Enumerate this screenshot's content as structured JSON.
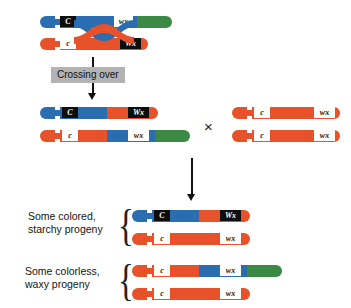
{
  "diagram": {
    "crossing_over_label": "Crossing over",
    "cross_symbol": "×",
    "brace_glyph": "{",
    "colors": {
      "blue": "#2a6db0",
      "red": "#e8522a",
      "green": "#3a8a45",
      "dark_box": "#0d0d0d",
      "light_box": "#fdfdfa",
      "label_box_bg": "#b3b3b3",
      "arrow": "#111111",
      "background": "#ffffff"
    },
    "alleles": {
      "C_dom": "C",
      "c_rec": "c",
      "Wx_dom": "Wx",
      "wx_rec": "wx"
    }
  },
  "parental_pair": {
    "caption": "Heterozygous parent before crossing over",
    "chromosomes": [
      {
        "id": "parental-blue",
        "color": "blue",
        "tip_color": "green",
        "alleles": [
          {
            "name": "C",
            "style": "dark"
          },
          {
            "name": "wx",
            "style": "light"
          }
        ]
      },
      {
        "id": "parental-red",
        "color": "red",
        "tip_color": "red",
        "alleles": [
          {
            "name": "c",
            "style": "light"
          },
          {
            "name": "Wx",
            "style": "dark"
          }
        ]
      }
    ]
  },
  "recombinant_pair": {
    "caption": "Recombinant chromosomes after crossing over",
    "chromosomes": [
      {
        "id": "recombinant-1",
        "segments": [
          "blue",
          "red"
        ],
        "alleles": [
          {
            "name": "C",
            "style": "dark"
          },
          {
            "name": "Wx",
            "style": "dark"
          }
        ]
      },
      {
        "id": "recombinant-2",
        "segments": [
          "red",
          "blue",
          "green"
        ],
        "alleles": [
          {
            "name": "c",
            "style": "light"
          },
          {
            "name": "wx",
            "style": "light"
          }
        ]
      }
    ]
  },
  "tester_pair": {
    "caption": "Homozygous recessive tester parent",
    "chromosomes": [
      {
        "id": "tester-1",
        "color": "red",
        "alleles": [
          {
            "name": "c",
            "style": "light"
          },
          {
            "name": "wx",
            "style": "light"
          }
        ]
      },
      {
        "id": "tester-2",
        "color": "red",
        "alleles": [
          {
            "name": "c",
            "style": "light"
          },
          {
            "name": "wx",
            "style": "light"
          }
        ]
      }
    ]
  },
  "progeny": [
    {
      "id": "progeny-colored-starchy",
      "label_line1": "Some colored,",
      "label_line2": "starchy progeny",
      "chromosomes": [
        {
          "id": "progeny-1-chrom-1",
          "segments": [
            "blue",
            "red"
          ],
          "alleles": [
            {
              "name": "C",
              "style": "dark"
            },
            {
              "name": "Wx",
              "style": "dark"
            }
          ]
        },
        {
          "id": "progeny-1-chrom-2",
          "segments": [
            "red"
          ],
          "alleles": [
            {
              "name": "c",
              "style": "light"
            },
            {
              "name": "wx",
              "style": "light"
            }
          ]
        }
      ]
    },
    {
      "id": "progeny-colorless-waxy",
      "label_line1": "Some colorless,",
      "label_line2": "waxy progeny",
      "chromosomes": [
        {
          "id": "progeny-2-chrom-1",
          "segments": [
            "red",
            "blue",
            "green"
          ],
          "alleles": [
            {
              "name": "c",
              "style": "light"
            },
            {
              "name": "wx",
              "style": "light"
            }
          ]
        },
        {
          "id": "progeny-2-chrom-2",
          "segments": [
            "red"
          ],
          "alleles": [
            {
              "name": "c",
              "style": "light"
            },
            {
              "name": "wx",
              "style": "light"
            }
          ]
        }
      ]
    }
  ]
}
